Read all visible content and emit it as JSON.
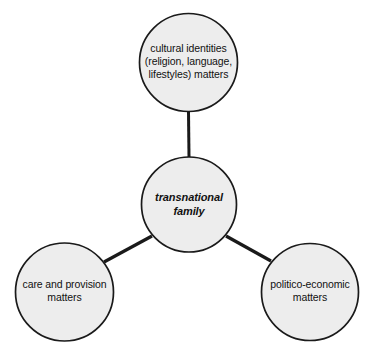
{
  "diagram": {
    "type": "hub-and-spoke concept map",
    "background_color": "#ffffff",
    "node_fill_color": "#ededed",
    "node_stroke_color": "#1a1a1a",
    "connector_color": "#1a1a1a",
    "text_color": "#111111",
    "center_node": {
      "id": "transnational-family",
      "label": "transnational\nfamily",
      "style": "bold italic",
      "cx": 189,
      "cy": 204,
      "r": 48
    },
    "satellite_nodes": [
      {
        "id": "cultural-identities",
        "label": "cultural identities\n(religion, language,\nlifestyles) matters",
        "cx": 188,
        "cy": 62,
        "r": 49.5,
        "position": "top"
      },
      {
        "id": "care-and-provision",
        "label": "care and provision\nmatters",
        "cx": 64,
        "cy": 292,
        "r": 49.5,
        "position": "bottom-left"
      },
      {
        "id": "politico-economic",
        "label": "politico-economic\nmatters",
        "cx": 310,
        "cy": 292,
        "r": 49,
        "position": "bottom-right"
      }
    ],
    "connectors": [
      {
        "id": "connector-top",
        "from": "transnational-family",
        "to": "cultural-identities"
      },
      {
        "id": "connector-bottom-left",
        "from": "transnational-family",
        "to": "care-and-provision"
      },
      {
        "id": "connector-bottom-right",
        "from": "transnational-family",
        "to": "politico-economic"
      }
    ]
  }
}
